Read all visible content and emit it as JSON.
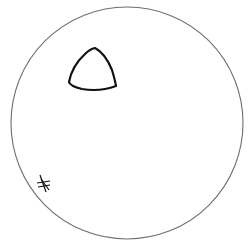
{
  "drawing": {
    "type": "hand-drawn sketch",
    "background": "#ffffff",
    "stroke_color": "#1a1a1a",
    "elements": [
      {
        "shape": "circle",
        "name": "outer-circle",
        "cx": 127,
        "cy": 123,
        "r": 116
      },
      {
        "shape": "rounded-triangle",
        "name": "triangle",
        "vertices": [
          [
            95,
            48
          ],
          [
            69,
            82
          ],
          [
            116,
            86
          ]
        ]
      },
      {
        "shape": "asterisk",
        "name": "star-mark",
        "cx": 43,
        "cy": 183
      }
    ]
  }
}
